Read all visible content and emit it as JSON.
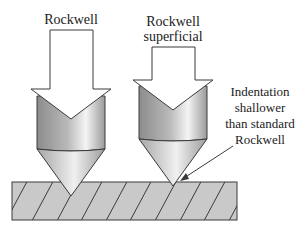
{
  "diagram": {
    "labels": {
      "rockwell": "Rockwell",
      "superficial_line1": "Rockwell",
      "superficial_line2": "superficial",
      "note_line1": "Indentation",
      "note_line2": "shallower",
      "note_line3": "than standard",
      "note_line4": "Rockwell"
    },
    "colors": {
      "stroke": "#3a3a3a",
      "block_fill": "#c8c8c8",
      "metal_dark": "#8a8a8a",
      "metal_light": "#f2f2f2"
    }
  }
}
